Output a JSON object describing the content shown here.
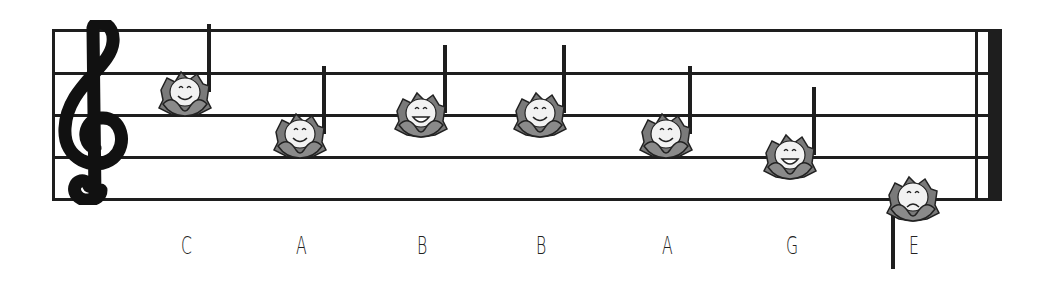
{
  "staff": {
    "clef": "treble-clef",
    "line_color": "#1e1e1e",
    "lines_y": [
      30,
      73,
      115,
      157,
      199
    ]
  },
  "notes": [
    {
      "name": "C",
      "x": 185,
      "y": 94,
      "stem": "up",
      "face": "smile"
    },
    {
      "name": "A",
      "x": 300,
      "y": 136,
      "stem": "up",
      "face": "smile"
    },
    {
      "name": "B",
      "x": 421,
      "y": 115,
      "stem": "up",
      "face": "grin"
    },
    {
      "name": "B",
      "x": 540,
      "y": 115,
      "stem": "up",
      "face": "smile"
    },
    {
      "name": "A",
      "x": 666,
      "y": 136,
      "stem": "up",
      "face": "smile"
    },
    {
      "name": "G",
      "x": 790,
      "y": 157,
      "stem": "up",
      "face": "grin"
    },
    {
      "name": "E",
      "x": 913,
      "y": 199,
      "stem": "down",
      "face": "frown"
    }
  ],
  "labels": [
    "C",
    "A",
    "B",
    "B",
    "A",
    "G",
    "E"
  ]
}
